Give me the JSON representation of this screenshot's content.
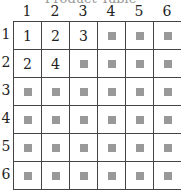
{
  "title": "Product Table",
  "columns": [
    "1",
    "2",
    "3",
    "4",
    "5",
    "6"
  ],
  "rows": [
    "1",
    "2",
    "3",
    "4",
    "5",
    "6"
  ],
  "cells": [
    [
      "1",
      "2",
      "3",
      "",
      "",
      ""
    ],
    [
      "2",
      "4",
      "",
      "",
      "",
      ""
    ],
    [
      "",
      "",
      "",
      "",
      "",
      ""
    ],
    [
      "",
      "",
      "",
      "",
      "",
      ""
    ],
    [
      "",
      "",
      "",
      "",
      "",
      ""
    ],
    [
      "",
      "",
      "",
      "",
      "",
      ""
    ]
  ],
  "placeholder_color": "#999999"
}
